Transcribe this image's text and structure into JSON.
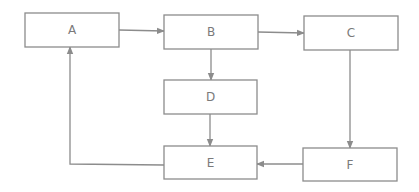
{
  "diagram": {
    "type": "flowchart",
    "colors": {
      "stroke": "#8c8c8c",
      "text": "#7a7a7a",
      "background": "#ffffff"
    },
    "nodes": [
      {
        "id": "A",
        "label": "A",
        "x": 25,
        "y": 13,
        "w": 94,
        "h": 34
      },
      {
        "id": "B",
        "label": "B",
        "x": 164,
        "y": 15,
        "w": 94,
        "h": 34
      },
      {
        "id": "C",
        "label": "C",
        "x": 304,
        "y": 16,
        "w": 94,
        "h": 34
      },
      {
        "id": "D",
        "label": "D",
        "x": 164,
        "y": 80,
        "w": 93,
        "h": 34
      },
      {
        "id": "E",
        "label": "E",
        "x": 164,
        "y": 146,
        "w": 93,
        "h": 33
      },
      {
        "id": "F",
        "label": "F",
        "x": 303,
        "y": 148,
        "w": 94,
        "h": 33
      }
    ],
    "edges": [
      {
        "from": "A",
        "to": "B",
        "points": [
          [
            119,
            30
          ],
          [
            164,
            31
          ]
        ]
      },
      {
        "from": "B",
        "to": "C",
        "points": [
          [
            258,
            32
          ],
          [
            304,
            33
          ]
        ]
      },
      {
        "from": "B",
        "to": "D",
        "points": [
          [
            211,
            49
          ],
          [
            211,
            80
          ]
        ]
      },
      {
        "from": "C",
        "to": "F",
        "points": [
          [
            350,
            50
          ],
          [
            350,
            148
          ]
        ]
      },
      {
        "from": "D",
        "to": "E",
        "points": [
          [
            210,
            114
          ],
          [
            210,
            146
          ]
        ]
      },
      {
        "from": "F",
        "to": "E",
        "points": [
          [
            303,
            164
          ],
          [
            257,
            164
          ]
        ]
      },
      {
        "from": "E",
        "to": "A",
        "points": [
          [
            164,
            165
          ],
          [
            70,
            164
          ],
          [
            70,
            47
          ]
        ]
      }
    ]
  }
}
